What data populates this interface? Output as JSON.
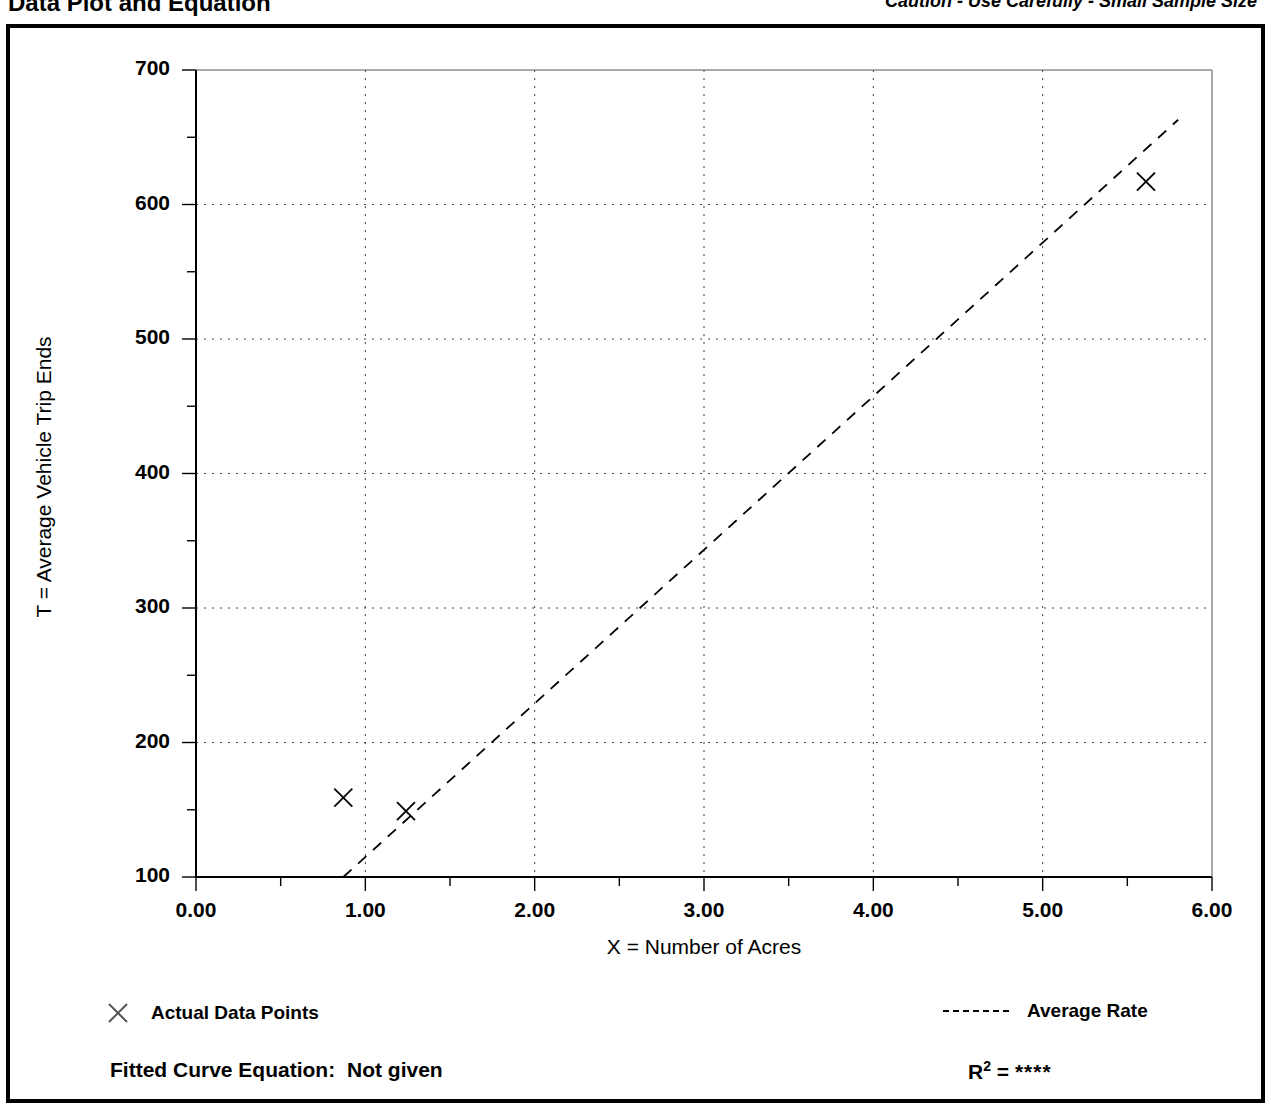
{
  "header": {
    "title": "Data Plot and Equation",
    "caution": "Caution - Use Carefully - Small Sample Size"
  },
  "legend": {
    "points_marker": "x-marker-icon",
    "points_label": "Actual Data Points",
    "line_marker": "dashed-line-icon",
    "line_label": "Average Rate"
  },
  "footer": {
    "fitted_label": "Fitted Curve Equation:",
    "fitted_value": "Not given",
    "r2_label": "R",
    "r2_exp": "2",
    "r2_eq": "=",
    "r2_value": "****"
  },
  "chart_data": {
    "type": "scatter",
    "title": "Data Plot and Equation",
    "subtitle": "Caution - Use Carefully - Small Sample Size",
    "xlabel": "X = Number of Acres",
    "ylabel": "T = Average Vehicle Trip Ends",
    "xlim": [
      0.0,
      6.0
    ],
    "ylim": [
      100,
      700
    ],
    "xticks": [
      0.0,
      1.0,
      2.0,
      3.0,
      4.0,
      5.0,
      6.0
    ],
    "xtick_labels": [
      "0.00",
      "1.00",
      "2.00",
      "3.00",
      "4.00",
      "5.00",
      "6.00"
    ],
    "yticks": [
      100,
      200,
      300,
      400,
      500,
      600,
      700
    ],
    "ytick_labels": [
      "100",
      "200",
      "300",
      "400",
      "500",
      "600",
      "700"
    ],
    "x_minor_step": 0.5,
    "y_minor_step": 50,
    "grid": true,
    "grid_style": "dotted",
    "legend_position": "below-plot",
    "series": [
      {
        "name": "Actual Data Points",
        "type": "scatter",
        "marker": "x",
        "color": "#000000",
        "points": [
          {
            "x": 0.87,
            "y": 159
          },
          {
            "x": 1.24,
            "y": 149
          },
          {
            "x": 5.61,
            "y": 617
          }
        ]
      },
      {
        "name": "Average Rate",
        "type": "line",
        "style": "dashed",
        "color": "#000000",
        "points": [
          {
            "x": 0.87,
            "y": 100
          },
          {
            "x": 5.8,
            "y": 663
          }
        ]
      }
    ]
  }
}
